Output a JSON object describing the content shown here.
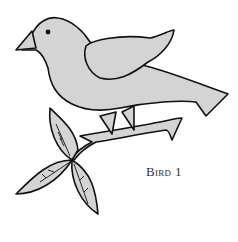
{
  "illustration": {
    "subject": "bird-on-branch",
    "caption": "Bird 1",
    "fill_color": "#d4d4d4",
    "line_color": "#111111"
  }
}
